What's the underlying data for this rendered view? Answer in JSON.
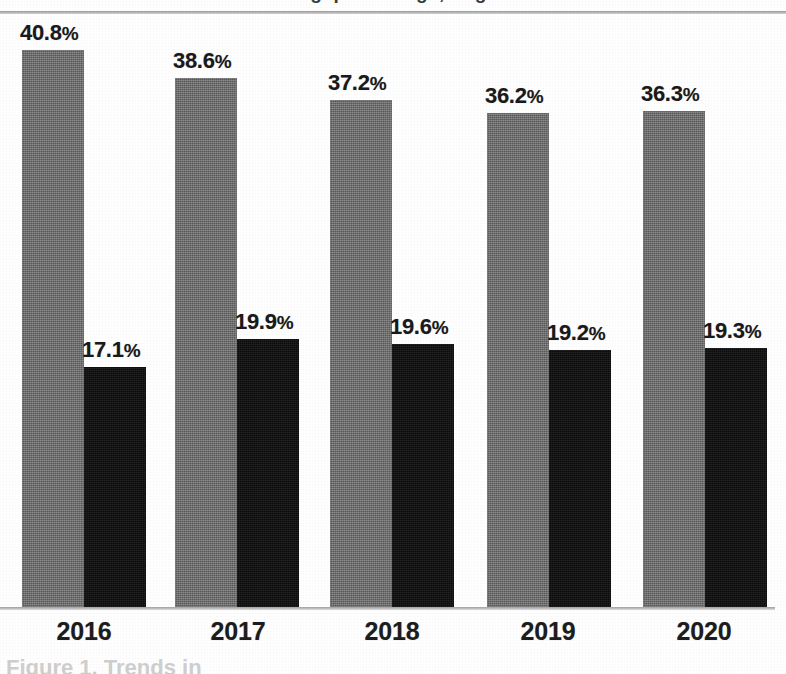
{
  "figure": {
    "title_partial": "avg. percentage, large",
    "caption_partial": "Figure 1.  Trends in",
    "axis_color": "#b0b0b0",
    "background": "#ffffff"
  },
  "chart_data": {
    "type": "bar",
    "title": "avg. percentage, large",
    "xlabel": "",
    "ylabel": "",
    "categories": [
      "2016",
      "2017",
      "2018",
      "2019",
      "2020"
    ],
    "grid": false,
    "legend_position": "none",
    "ylim": [
      0,
      44
    ],
    "value_label_suffix": "%",
    "series": [
      {
        "name": "gray-series",
        "color": "#6b6b6b",
        "values": [
          40.8,
          38.6,
          37.2,
          36.2,
          36.3
        ],
        "labels": [
          "40.8%",
          "38.6%",
          "37.2%",
          "36.2%",
          "36.3%"
        ]
      },
      {
        "name": "black-series",
        "color": "#111111",
        "values": [
          17.1,
          19.9,
          19.6,
          19.2,
          19.3
        ],
        "labels": [
          "17.1%",
          "19.9%",
          "19.6%",
          "19.2%",
          "19.3%"
        ]
      }
    ]
  },
  "geometry": {
    "baseline_y": 607,
    "plot_top": 14,
    "bar_width": 62,
    "group_starts": [
      22,
      175,
      330,
      487,
      643
    ],
    "gray_tops": [
      50,
      78,
      100,
      113,
      111
    ],
    "dark_tops": [
      367,
      339,
      344,
      350,
      348
    ],
    "label_centers": [
      84,
      238,
      392,
      548,
      704
    ]
  }
}
